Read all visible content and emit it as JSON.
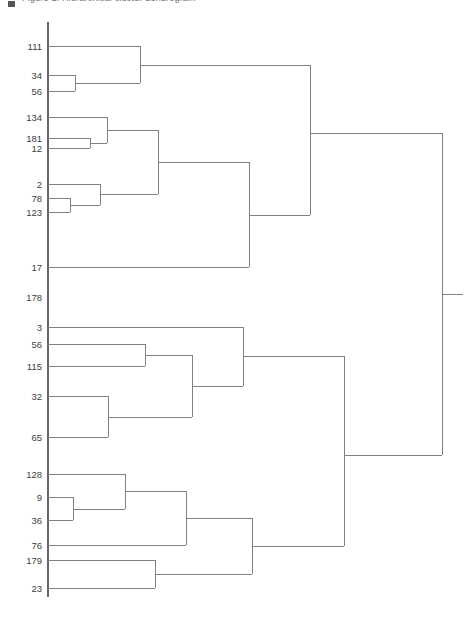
{
  "figure": {
    "caption_fragment": "Figure 1.  Hierarchical cluster dendrogram",
    "background_color": "#ffffff",
    "line_color": "#808080",
    "axis_color": "#66666c",
    "label_color": "#3d3d42"
  },
  "chart_data": {
    "type": "dendrogram",
    "title": "",
    "xlabel": "",
    "ylabel": "",
    "orientation": "horizontal-right",
    "grid": false,
    "legend": null,
    "axis": {
      "spine_x": 48,
      "spine_top_y": 22,
      "spine_bottom_y": 597,
      "ticks": [],
      "tick_labels": []
    },
    "leaf_labels": [
      "111",
      "34",
      "56",
      "134",
      "181",
      "12",
      "2",
      "78",
      "123",
      "17",
      "178",
      "3",
      "56",
      "115",
      "32",
      "65",
      "128",
      "9",
      "36",
      "76",
      "179",
      "23"
    ],
    "leaves": [
      {
        "label": "111",
        "x": 48,
        "y": 46
      },
      {
        "label": "34",
        "x": 48,
        "y": 75
      },
      {
        "label": "56",
        "x": 48,
        "y": 91
      },
      {
        "label": "134",
        "x": 48,
        "y": 117
      },
      {
        "label": "181",
        "x": 48,
        "y": 138
      },
      {
        "label": "12",
        "x": 48,
        "y": 148
      },
      {
        "label": "2",
        "x": 48,
        "y": 184
      },
      {
        "label": "78",
        "x": 48,
        "y": 198
      },
      {
        "label": "123",
        "x": 48,
        "y": 212
      },
      {
        "label": "17",
        "x": 48,
        "y": 267
      },
      {
        "label": "178",
        "x": 48,
        "y": 297
      },
      {
        "label": "3",
        "x": 48,
        "y": 327
      },
      {
        "label": "56",
        "x": 48,
        "y": 344
      },
      {
        "label": "115",
        "x": 48,
        "y": 366
      },
      {
        "label": "32",
        "x": 48,
        "y": 396
      },
      {
        "label": "65",
        "x": 48,
        "y": 437
      },
      {
        "label": "128",
        "x": 48,
        "y": 474
      },
      {
        "label": "9",
        "x": 48,
        "y": 497
      },
      {
        "label": "36",
        "x": 48,
        "y": 520
      },
      {
        "label": "76",
        "x": 48,
        "y": 545
      },
      {
        "label": "179",
        "x": 48,
        "y": 560
      },
      {
        "label": "23",
        "x": 48,
        "y": 588
      }
    ],
    "links": [
      {
        "id": "n1",
        "name": "merge-34-56",
        "x": 75,
        "y_top": 75,
        "y_bottom": 91,
        "x_top": 48,
        "x_bottom": 48
      },
      {
        "id": "n2",
        "name": "merge-111-with-34-56",
        "x": 140,
        "y_top": 46,
        "y_bottom": 83,
        "x_top": 48,
        "x_bottom": 75
      },
      {
        "id": "n3",
        "name": "merge-181-12",
        "x": 90,
        "y_top": 138,
        "y_bottom": 148,
        "x_top": 48,
        "x_bottom": 48
      },
      {
        "id": "n4",
        "name": "merge-134-with-181-12",
        "x": 107,
        "y_top": 117,
        "y_bottom": 143,
        "x_top": 48,
        "x_bottom": 90
      },
      {
        "id": "n5",
        "name": "merge-78-123",
        "x": 70,
        "y_top": 198,
        "y_bottom": 212,
        "x_top": 48,
        "x_bottom": 48
      },
      {
        "id": "n6",
        "name": "merge-2-with-78-123",
        "x": 100,
        "y_top": 184,
        "y_bottom": 205,
        "x_top": 48,
        "x_bottom": 70
      },
      {
        "id": "n7",
        "name": "merge-134grp-2grp",
        "x": 158,
        "y_top": 130,
        "y_bottom": 194,
        "x_top": 107,
        "x_bottom": 100
      },
      {
        "id": "n8",
        "name": "merge-17-with-134grp",
        "x": 249,
        "y_top": 162,
        "y_bottom": 267,
        "x_top": 158,
        "x_bottom": 48
      },
      {
        "id": "n9",
        "name": "merge-111grp-17grp",
        "x": 310,
        "y_top": 65,
        "y_bottom": 215,
        "x_top": 140,
        "x_bottom": 249
      },
      {
        "id": "n10",
        "name": "merge-56-115",
        "x": 145,
        "y_top": 344,
        "y_bottom": 366,
        "x_top": 48,
        "x_bottom": 48
      },
      {
        "id": "n11",
        "name": "merge-32-65",
        "x": 108,
        "y_top": 396,
        "y_bottom": 437,
        "x_top": 48,
        "x_bottom": 48
      },
      {
        "id": "n12",
        "name": "merge-56115-3265",
        "x": 192,
        "y_top": 355,
        "y_bottom": 417,
        "x_top": 145,
        "x_bottom": 108
      },
      {
        "id": "n13",
        "name": "merge-3-with-cluster",
        "x": 243,
        "y_top": 327,
        "y_bottom": 386,
        "x_top": 48,
        "x_bottom": 192
      },
      {
        "id": "n14",
        "name": "merge-9-36",
        "x": 73,
        "y_top": 497,
        "y_bottom": 520,
        "x_top": 48,
        "x_bottom": 48
      },
      {
        "id": "n15",
        "name": "merge-128-with-9-36",
        "x": 125,
        "y_top": 474,
        "y_bottom": 509,
        "x_top": 48,
        "x_bottom": 73
      },
      {
        "id": "n16",
        "name": "merge-76-with-128grp",
        "x": 186,
        "y_top": 491,
        "y_bottom": 545,
        "x_top": 125,
        "x_bottom": 48
      },
      {
        "id": "n17",
        "name": "merge-179-23",
        "x": 155,
        "y_top": 560,
        "y_bottom": 588,
        "x_top": 48,
        "x_bottom": 48
      },
      {
        "id": "n18",
        "name": "merge-76grp-179grp",
        "x": 252,
        "y_top": 518,
        "y_bottom": 574,
        "x_top": 186,
        "x_bottom": 155
      },
      {
        "id": "n19",
        "name": "merge-3grp-bottomgrp",
        "x": 344,
        "y_top": 356,
        "y_bottom": 546,
        "x_top": 243,
        "x_bottom": 252
      },
      {
        "id": "n20",
        "name": "root-merge",
        "x": 442,
        "y_top": 133,
        "y_bottom": 455,
        "x_top": 310,
        "x_bottom": 344
      }
    ]
  }
}
